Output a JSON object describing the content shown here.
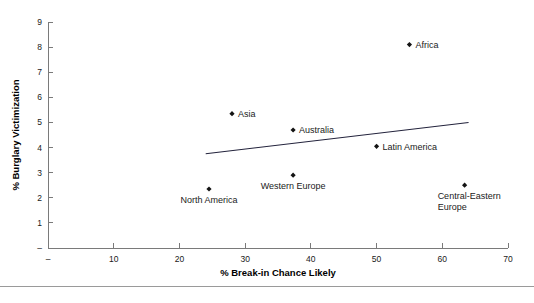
{
  "chart_data": {
    "type": "scatter",
    "title": "",
    "xlabel": "% Break-in Chance Likely",
    "ylabel": "% Burglary Victimization",
    "xlim": [
      0,
      70
    ],
    "ylim": [
      0,
      9
    ],
    "grid": false,
    "legend": "none",
    "xticks": [
      "–",
      "10",
      "20",
      "30",
      "40",
      "50",
      "60",
      "70"
    ],
    "xtick_values": [
      0,
      10,
      20,
      30,
      40,
      50,
      60,
      70
    ],
    "yticks": [
      "–",
      "1",
      "2",
      "3",
      "4",
      "5",
      "6",
      "7",
      "8",
      "9"
    ],
    "ytick_values": [
      0,
      1,
      2,
      3,
      4,
      5,
      6,
      7,
      8,
      9
    ],
    "points": [
      {
        "label": "Africa",
        "x": 55.0,
        "y": 8.1,
        "label_pos": "right"
      },
      {
        "label": "Asia",
        "x": 28.0,
        "y": 5.35,
        "label_pos": "right"
      },
      {
        "label": "Australia",
        "x": 37.3,
        "y": 4.7,
        "label_pos": "right"
      },
      {
        "label": "Latin America",
        "x": 50.0,
        "y": 4.05,
        "label_pos": "right"
      },
      {
        "label": "Western Europe",
        "x": 37.3,
        "y": 2.9,
        "label_pos": "below"
      },
      {
        "label": "North America",
        "x": 24.5,
        "y": 2.35,
        "label_pos": "below"
      },
      {
        "label": "Central-Eastern Europe",
        "x": 63.4,
        "y": 2.5,
        "label_pos": "below"
      }
    ],
    "trendline": {
      "x0": 24.0,
      "y0": 3.75,
      "x1": 64.0,
      "y1": 5.0,
      "color": "#23233c"
    }
  },
  "colors": {
    "marker": "#141414",
    "axis": "#7a7a7a",
    "trend": "#23233c",
    "text": "#1a1a1a",
    "background": "#ffffff",
    "rule": "#9a9a9a"
  }
}
